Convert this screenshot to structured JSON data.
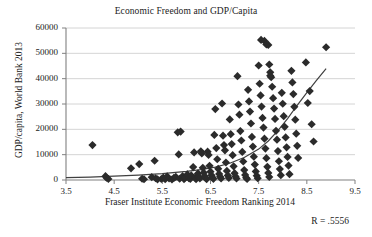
{
  "chart_data": {
    "type": "scatter",
    "title": "Economic Freedom and GDP/Capita",
    "xlabel": "Fraser Institute Economic Freedom Ranking 2014",
    "ylabel": "GDP/capita, World Bank 2013",
    "annotation": "R = .5556",
    "xlim": [
      3.5,
      9.5
    ],
    "ylim": [
      0,
      60000
    ],
    "xticks": [
      "3.5",
      "4.5",
      "5.5",
      "6.5",
      "7.5",
      "8.5",
      "9.5"
    ],
    "xtick_values": [
      3.5,
      4.5,
      5.5,
      6.5,
      7.5,
      8.5,
      9.5
    ],
    "yticks": [
      "0",
      "10000",
      "20000",
      "30000",
      "40000",
      "50000",
      "60000"
    ],
    "ytick_values": [
      0,
      10000,
      20000,
      30000,
      40000,
      50000,
      60000
    ],
    "grid": "horizontal",
    "legend": "none",
    "marker": "diamond",
    "marker_color": "#2b2b2b",
    "marker_size": 7,
    "gridline_color": "#c9c9c9",
    "axis_color": "#808080",
    "trendline": {
      "type": "exponential",
      "color": "#404040",
      "x_start": 3.5,
      "x_end": 8.9,
      "points": [
        [
          3.5,
          900
        ],
        [
          4.0,
          1150
        ],
        [
          4.5,
          1500
        ],
        [
          5.0,
          1950
        ],
        [
          5.5,
          2550
        ],
        [
          6.0,
          3400
        ],
        [
          6.3,
          4100
        ],
        [
          6.6,
          5100
        ],
        [
          6.9,
          6600
        ],
        [
          7.2,
          8900
        ],
        [
          7.5,
          12200
        ],
        [
          7.7,
          15400
        ],
        [
          7.9,
          19500
        ],
        [
          8.1,
          24200
        ],
        [
          8.3,
          29500
        ],
        [
          8.5,
          34500
        ],
        [
          8.7,
          39300
        ],
        [
          8.9,
          44000
        ]
      ]
    },
    "points": [
      [
        4.05,
        13800
      ],
      [
        4.32,
        1500
      ],
      [
        4.34,
        900
      ],
      [
        4.38,
        400
      ],
      [
        4.85,
        4600
      ],
      [
        5.02,
        6300
      ],
      [
        5.08,
        500
      ],
      [
        5.12,
        300
      ],
      [
        5.28,
        1100
      ],
      [
        5.34,
        7600
      ],
      [
        5.36,
        700
      ],
      [
        5.4,
        250
      ],
      [
        5.48,
        400
      ],
      [
        5.52,
        900
      ],
      [
        5.56,
        300
      ],
      [
        5.6,
        1400
      ],
      [
        5.64,
        600
      ],
      [
        5.7,
        200
      ],
      [
        5.74,
        800
      ],
      [
        5.78,
        1200
      ],
      [
        5.82,
        18800
      ],
      [
        5.88,
        19100
      ],
      [
        5.84,
        10100
      ],
      [
        5.86,
        500
      ],
      [
        5.92,
        1500
      ],
      [
        5.95,
        350
      ],
      [
        5.98,
        950
      ],
      [
        6.02,
        2200
      ],
      [
        6.05,
        700
      ],
      [
        6.08,
        400
      ],
      [
        6.1,
        1800
      ],
      [
        6.14,
        5100
      ],
      [
        6.16,
        10900
      ],
      [
        6.18,
        900
      ],
      [
        6.2,
        300
      ],
      [
        6.24,
        2600
      ],
      [
        6.26,
        1200
      ],
      [
        6.28,
        600
      ],
      [
        6.3,
        11300
      ],
      [
        6.32,
        10500
      ],
      [
        6.34,
        4800
      ],
      [
        6.36,
        2900
      ],
      [
        6.38,
        1500
      ],
      [
        6.4,
        700
      ],
      [
        6.42,
        350
      ],
      [
        6.44,
        11200
      ],
      [
        6.46,
        9900
      ],
      [
        6.48,
        5600
      ],
      [
        6.5,
        3300
      ],
      [
        6.52,
        1900
      ],
      [
        6.54,
        1000
      ],
      [
        6.56,
        450
      ],
      [
        6.58,
        17800
      ],
      [
        6.6,
        28000
      ],
      [
        6.62,
        12600
      ],
      [
        6.64,
        8200
      ],
      [
        6.66,
        4400
      ],
      [
        6.68,
        2400
      ],
      [
        6.7,
        1300
      ],
      [
        6.72,
        600
      ],
      [
        6.74,
        30200
      ],
      [
        6.76,
        17500
      ],
      [
        6.78,
        13800
      ],
      [
        6.8,
        11700
      ],
      [
        6.82,
        6900
      ],
      [
        6.84,
        3600
      ],
      [
        6.86,
        1800
      ],
      [
        6.88,
        800
      ],
      [
        6.9,
        23900
      ],
      [
        6.92,
        18100
      ],
      [
        6.94,
        14200
      ],
      [
        6.96,
        9800
      ],
      [
        6.98,
        5400
      ],
      [
        7.0,
        2700
      ],
      [
        7.02,
        1400
      ],
      [
        7.04,
        600
      ],
      [
        7.06,
        41000
      ],
      [
        7.08,
        29800
      ],
      [
        7.1,
        25800
      ],
      [
        7.12,
        19300
      ],
      [
        7.14,
        15600
      ],
      [
        7.16,
        11100
      ],
      [
        7.18,
        7300
      ],
      [
        7.2,
        3900
      ],
      [
        7.22,
        2000
      ],
      [
        7.24,
        900
      ],
      [
        7.26,
        400
      ],
      [
        7.28,
        35600
      ],
      [
        7.3,
        31000
      ],
      [
        7.32,
        27000
      ],
      [
        7.34,
        22300
      ],
      [
        7.36,
        17000
      ],
      [
        7.38,
        13200
      ],
      [
        7.4,
        9200
      ],
      [
        7.42,
        6100
      ],
      [
        7.44,
        3400
      ],
      [
        7.46,
        1700
      ],
      [
        7.48,
        700
      ],
      [
        7.5,
        45200
      ],
      [
        7.52,
        38000
      ],
      [
        7.54,
        33400
      ],
      [
        7.56,
        29000
      ],
      [
        7.58,
        24500
      ],
      [
        7.6,
        20700
      ],
      [
        7.62,
        16300
      ],
      [
        7.64,
        12400
      ],
      [
        7.66,
        8600
      ],
      [
        7.68,
        5200
      ],
      [
        7.7,
        2800
      ],
      [
        7.72,
        1200
      ],
      [
        7.55,
        55300
      ],
      [
        7.62,
        54900
      ],
      [
        7.66,
        53500
      ],
      [
        7.7,
        53300
      ],
      [
        7.74,
        42500
      ],
      [
        7.76,
        40600
      ],
      [
        7.78,
        36800
      ],
      [
        7.8,
        32300
      ],
      [
        7.82,
        28200
      ],
      [
        7.84,
        24100
      ],
      [
        7.86,
        19400
      ],
      [
        7.88,
        15900
      ],
      [
        7.9,
        11400
      ],
      [
        7.92,
        7400
      ],
      [
        7.94,
        4300
      ],
      [
        7.96,
        1900
      ],
      [
        7.72,
        45600
      ],
      [
        7.74,
        41200
      ],
      [
        7.98,
        34400
      ],
      [
        8.0,
        30100
      ],
      [
        8.02,
        25200
      ],
      [
        8.04,
        21000
      ],
      [
        8.06,
        16800
      ],
      [
        8.08,
        12900
      ],
      [
        8.1,
        9100
      ],
      [
        8.12,
        5700
      ],
      [
        8.14,
        2300
      ],
      [
        8.18,
        43100
      ],
      [
        8.2,
        38500
      ],
      [
        8.22,
        33900
      ],
      [
        8.24,
        28900
      ],
      [
        8.26,
        23800
      ],
      [
        8.28,
        18300
      ],
      [
        8.3,
        13500
      ],
      [
        8.32,
        8700
      ],
      [
        8.48,
        46400
      ],
      [
        8.52,
        30400
      ],
      [
        8.56,
        35100
      ],
      [
        8.6,
        22000
      ],
      [
        8.64,
        15200
      ],
      [
        8.9,
        52400
      ]
    ]
  }
}
